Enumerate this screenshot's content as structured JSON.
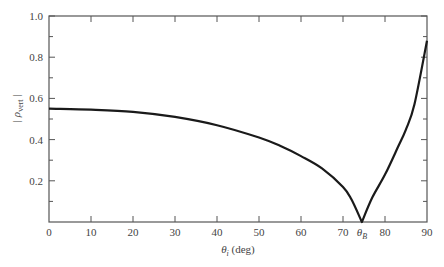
{
  "chart_data": {
    "type": "line",
    "title": "",
    "xlabel": "θi (deg)",
    "xlabel_main": "θ",
    "xlabel_sub": "i",
    "xlabel_unit": " (deg)",
    "ylabel": "| ρvert |",
    "ylabel_main": "| ρ",
    "ylabel_sub": "vert",
    "ylabel_end": " |",
    "xlim": [
      0,
      90
    ],
    "ylim": [
      0,
      1.0
    ],
    "x_ticks": [
      0,
      10,
      20,
      30,
      40,
      50,
      60,
      70,
      80,
      90
    ],
    "x_tick_labels": [
      "0",
      "10",
      "20",
      "30",
      "40",
      "50",
      "60",
      "70",
      "80",
      "90"
    ],
    "y_ticks": [
      0.2,
      0.4,
      0.6,
      0.8,
      1.0
    ],
    "y_tick_labels": [
      "0.2",
      "0.4",
      "0.6",
      "0.8",
      "1.0"
    ],
    "annotations": [
      {
        "text": "θB",
        "main": "θ",
        "sub": "B",
        "x": 74.5,
        "y": 0
      }
    ],
    "grid": false,
    "legend": null,
    "series": [
      {
        "name": "|ρvert|",
        "x": [
          0,
          10,
          20,
          30,
          40,
          50,
          55,
          60,
          65,
          70,
          72,
          74.5,
          77,
          80,
          83,
          85,
          87,
          90
        ],
        "y": [
          0.55,
          0.545,
          0.535,
          0.51,
          0.47,
          0.41,
          0.37,
          0.32,
          0.26,
          0.17,
          0.11,
          0.0,
          0.12,
          0.23,
          0.36,
          0.45,
          0.57,
          0.88
        ]
      }
    ],
    "color": "#1a1a1a"
  }
}
